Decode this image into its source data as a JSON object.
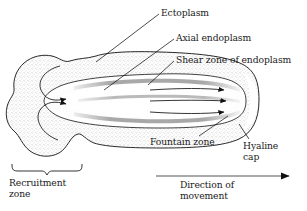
{
  "figure": {
    "background_color": "#ffffff",
    "ink_color": "#1a1a1a",
    "stipple_color": "#9a9a9a"
  },
  "labels": {
    "ectoplasm": "Ectoplasm",
    "axial_endoplasm": "Axial endoplasm",
    "shear_zone": "Shear zone of endoplasm",
    "fountain_zone": "Fountain zone",
    "hyaline_cap": "Hyaline cap",
    "recruitment_zone": "Recruitment zone",
    "direction_of_movement": "Direction of movement"
  }
}
